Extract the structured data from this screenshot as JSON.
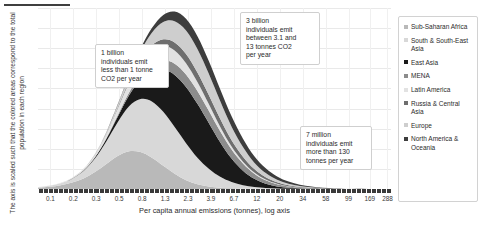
{
  "chart_data": {
    "type": "area",
    "title": "",
    "xlabel": "Per capita annual emissions (tonnes), log axis",
    "ylabel": "The axis is scaled such that the colored areas correspond to the total population in each region",
    "grid": true,
    "legend_position": "right",
    "x_scale": "log",
    "x_tick_labels": [
      "0.1",
      "0.2",
      "0.3",
      "0.5",
      "0.8",
      "1.3",
      "2.3",
      "3.9",
      "6.7",
      "12",
      "20",
      "34",
      "58",
      "99",
      "169",
      "288"
    ],
    "x_tick_positions_pct": [
      3.5,
      10.0,
      16.5,
      23.0,
      29.5,
      36.0,
      42.5,
      49.0,
      55.5,
      62.0,
      68.5,
      75.0,
      81.5,
      88.0,
      94.0,
      99.0
    ],
    "series": [
      {
        "name": "Sub-Saharan Africa",
        "color": "#b9b9b9",
        "values": [
          0.8,
          1.4,
          2.4,
          4.0,
          6.6,
          10.5,
          15.5,
          20.5,
          23.5,
          23.0,
          19.5,
          14.5,
          9.5,
          5.5,
          3.0,
          1.6,
          0.8,
          0.4,
          0.2,
          0.1,
          0.05,
          0.03,
          0.02,
          0.01,
          0.01,
          0.0,
          0.0,
          0.0,
          0.0,
          0.0,
          0.0,
          0.0
        ]
      },
      {
        "name": "South & South-East Asia",
        "color": "#d8d8d8",
        "values": [
          0.3,
          0.6,
          1.2,
          2.4,
          4.6,
          8.4,
          14.0,
          21.0,
          28.0,
          33.0,
          35.0,
          33.5,
          29.0,
          23.0,
          16.5,
          11.0,
          6.8,
          4.0,
          2.2,
          1.2,
          0.6,
          0.3,
          0.15,
          0.08,
          0.04,
          0.02,
          0.01,
          0.0,
          0.0,
          0.0,
          0.0,
          0.0
        ]
      },
      {
        "name": "East Asia",
        "color": "#1a1a1a",
        "values": [
          0.0,
          0.0,
          0.05,
          0.12,
          0.3,
          0.7,
          1.6,
          3.4,
          6.8,
          12.0,
          19.0,
          26.5,
          32.5,
          35.0,
          33.5,
          28.5,
          21.5,
          14.5,
          9.0,
          5.0,
          2.6,
          1.3,
          0.6,
          0.3,
          0.14,
          0.06,
          0.03,
          0.01,
          0.0,
          0.0,
          0.0,
          0.0
        ]
      },
      {
        "name": "MENA",
        "color": "#8c8c8c",
        "values": [
          0.0,
          0.0,
          0.0,
          0.05,
          0.1,
          0.25,
          0.5,
          1.0,
          1.8,
          3.0,
          4.4,
          5.8,
          7.0,
          7.8,
          8.0,
          7.6,
          6.8,
          5.6,
          4.4,
          3.2,
          2.2,
          1.4,
          0.85,
          0.5,
          0.3,
          0.16,
          0.08,
          0.04,
          0.02,
          0.01,
          0.0,
          0.0
        ]
      },
      {
        "name": "Latin America",
        "color": "#e2e2e2",
        "values": [
          0.05,
          0.1,
          0.2,
          0.4,
          0.8,
          1.5,
          2.6,
          4.2,
          6.0,
          7.6,
          8.6,
          8.8,
          8.2,
          7.0,
          5.6,
          4.2,
          2.9,
          1.9,
          1.2,
          0.7,
          0.4,
          0.22,
          0.12,
          0.06,
          0.03,
          0.015,
          0.008,
          0.0,
          0.0,
          0.0,
          0.0,
          0.0
        ]
      },
      {
        "name": "Russia & Central Asia",
        "color": "#6e6e6e",
        "values": [
          0.0,
          0.0,
          0.0,
          0.02,
          0.05,
          0.12,
          0.28,
          0.6,
          1.1,
          1.9,
          2.9,
          4.0,
          5.0,
          5.7,
          5.9,
          5.6,
          4.9,
          4.0,
          3.1,
          2.2,
          1.5,
          0.95,
          0.6,
          0.35,
          0.2,
          0.1,
          0.05,
          0.02,
          0.01,
          0.0,
          0.0,
          0.0
        ]
      },
      {
        "name": "Europe",
        "color": "#cecece",
        "values": [
          0.0,
          0.0,
          0.02,
          0.05,
          0.12,
          0.3,
          0.7,
          1.5,
          2.9,
          5.0,
          7.8,
          10.8,
          13.2,
          14.6,
          14.6,
          13.2,
          11.0,
          8.4,
          6.0,
          4.0,
          2.6,
          1.6,
          0.95,
          0.55,
          0.3,
          0.16,
          0.08,
          0.04,
          0.02,
          0.01,
          0.0,
          0.0
        ]
      },
      {
        "name": "North America & Oceania",
        "color": "#3d3d3d",
        "values": [
          0.0,
          0.0,
          0.0,
          0.01,
          0.03,
          0.08,
          0.2,
          0.45,
          0.9,
          1.7,
          2.9,
          4.4,
          6.0,
          7.3,
          8.0,
          8.0,
          7.4,
          6.4,
          5.2,
          4.0,
          2.9,
          2.0,
          1.3,
          0.85,
          0.52,
          0.3,
          0.17,
          0.09,
          0.045,
          0.02,
          0.01,
          0.0
        ]
      }
    ]
  },
  "legend": {
    "items": [
      {
        "label": "Sub-Saharan Africa",
        "color": "#b9b9b9"
      },
      {
        "label": "South & South-East Asia",
        "color": "#d8d8d8"
      },
      {
        "label": "East Asia",
        "color": "#1a1a1a"
      },
      {
        "label": "MENA",
        "color": "#8c8c8c"
      },
      {
        "label": "Latin America",
        "color": "#e2e2e2"
      },
      {
        "label": "Russia & Central Asia",
        "color": "#6e6e6e"
      },
      {
        "label": "Europe",
        "color": "#cecece"
      },
      {
        "label": "North America & Oceania",
        "color": "#3d3d3d"
      }
    ]
  },
  "annotations": [
    {
      "id": "callout-1",
      "text": "1 billion\nindividuals emit\nless than 1 tonne\nCO2 per year"
    },
    {
      "id": "callout-2",
      "text": "3 billion\nindividuals emit\nbetween 3.1 and\n13 tonnes CO2\nper year"
    },
    {
      "id": "callout-3",
      "text": "7 million\nindividuals emit\nmore than 130\ntonnes per year"
    }
  ]
}
